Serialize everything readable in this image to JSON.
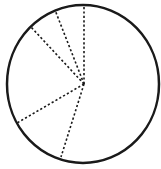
{
  "diagram": {
    "type": "circle-divided-into-sectors",
    "background": "#ffffff",
    "stroke_color": "#1a1a1a",
    "circle": {
      "cx": 83,
      "cy": 84,
      "rx": 76,
      "ry": 79,
      "stroke_width": 2.5
    },
    "center": {
      "x": 84,
      "y": 84
    },
    "dotted_radii": [
      {
        "x2": 84,
        "y2": 4
      },
      {
        "x2": 55,
        "y2": 10
      },
      {
        "x2": 31,
        "y2": 27
      },
      {
        "x2": 17,
        "y2": 123
      },
      {
        "x2": 61,
        "y2": 157
      }
    ]
  }
}
